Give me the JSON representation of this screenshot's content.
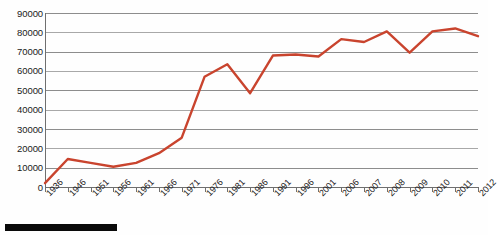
{
  "chart_data": {
    "type": "line",
    "title": "",
    "subtitle": "",
    "xlabel": "",
    "ylabel": "",
    "grid": true,
    "legend": false,
    "legend_position": "none",
    "series_color": "#c9442e",
    "ylim": [
      0,
      90000
    ],
    "ytick_labels": [
      "90000",
      "80000",
      "70000",
      "60000",
      "50000",
      "40000",
      "30000",
      "20000",
      "10000",
      "0"
    ],
    "yticks": [
      90000,
      80000,
      70000,
      60000,
      50000,
      40000,
      30000,
      20000,
      10000,
      0
    ],
    "categories": [
      "1936",
      "1946",
      "1951",
      "1956",
      "1961",
      "1966",
      "1971",
      "1976",
      "1981",
      "1986",
      "1991",
      "1996",
      "2001",
      "2006",
      "2007",
      "2008",
      "2009",
      "2010",
      "2011",
      "2012"
    ],
    "series": [
      {
        "name": "series-1",
        "values": [
          2000,
          14500,
          12500,
          10500,
          12500,
          17500,
          25500,
          57000,
          63500,
          48500,
          68000,
          68500,
          67500,
          76500,
          75000,
          80500,
          69500,
          80500,
          82000,
          78000
        ]
      }
    ],
    "annotations": [
      {
        "name": "black-bar",
        "kind": "redaction-bar",
        "color": "#0a0a0a"
      }
    ]
  }
}
